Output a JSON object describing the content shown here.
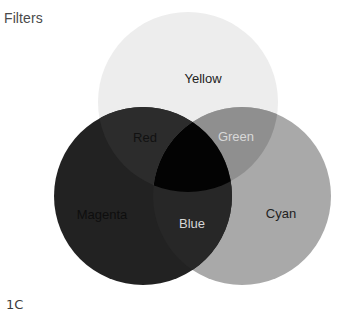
{
  "title": "Filters",
  "figure_label": "1C",
  "diagram": {
    "type": "venn",
    "circles": [
      {
        "name": "Yellow",
        "cx": 188,
        "cy": 102,
        "r": 90,
        "fill": "#ededed",
        "label_x": 203,
        "label_y": 80,
        "label_color": "#222222"
      },
      {
        "name": "Magenta",
        "cx": 143,
        "cy": 196,
        "r": 89,
        "fill": "#222222",
        "label_x": 102,
        "label_y": 216,
        "label_color": "#0e0e0e"
      },
      {
        "name": "Cyan",
        "cx": 242,
        "cy": 196,
        "r": 89,
        "fill": "#a9a9a9",
        "label_x": 281,
        "label_y": 215,
        "label_color": "#222222"
      }
    ],
    "intersections": [
      {
        "name": "Red",
        "between": [
          "Yellow",
          "Magenta"
        ],
        "fill": "#2a2a2a",
        "label_x": 145,
        "label_y": 139,
        "label_color": "#111111"
      },
      {
        "name": "Green",
        "between": [
          "Yellow",
          "Cyan"
        ],
        "fill": "#8d8d8d",
        "label_x": 236,
        "label_y": 138,
        "label_color": "#d8d8d8"
      },
      {
        "name": "Blue",
        "between": [
          "Magenta",
          "Cyan"
        ],
        "fill": "#262626",
        "label_x": 192,
        "label_y": 225,
        "label_color": "#d6d6d6"
      },
      {
        "name": "Black",
        "between": [
          "Yellow",
          "Magenta",
          "Cyan"
        ],
        "fill": "#030303"
      }
    ],
    "labels": {
      "yellow": "Yellow",
      "magenta": "Magenta",
      "cyan": "Cyan",
      "red": "Red",
      "green": "Green",
      "blue": "Blue"
    }
  }
}
